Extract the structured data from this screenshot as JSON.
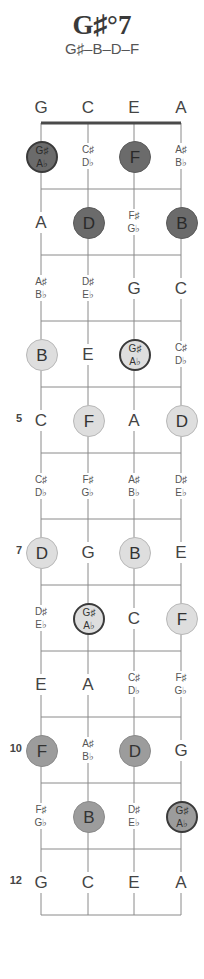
{
  "chord": {
    "title": "G♯°7",
    "notes_formula": "G♯–B–D–F"
  },
  "strings": [
    "G",
    "C",
    "E",
    "A"
  ],
  "fret_markers": [
    {
      "fret": 5,
      "label": "5"
    },
    {
      "fret": 7,
      "label": "7"
    },
    {
      "fret": 10,
      "label": "10"
    },
    {
      "fret": 12,
      "label": "12"
    }
  ],
  "rows": [
    {
      "fret": 1,
      "cells": [
        {
          "label": [
            "G♯",
            "A♭"
          ],
          "circle": "dark",
          "root": true
        },
        {
          "label": [
            "C♯",
            "D♭"
          ],
          "circle": "none"
        },
        {
          "label": [
            "F"
          ],
          "circle": "dark"
        },
        {
          "label": [
            "A♯",
            "B♭"
          ],
          "circle": "none"
        }
      ]
    },
    {
      "fret": 2,
      "cells": [
        {
          "label": [
            "A"
          ],
          "circle": "none"
        },
        {
          "label": [
            "D"
          ],
          "circle": "dark"
        },
        {
          "label": [
            "F♯",
            "G♭"
          ],
          "circle": "none"
        },
        {
          "label": [
            "B"
          ],
          "circle": "dark"
        }
      ]
    },
    {
      "fret": 3,
      "cells": [
        {
          "label": [
            "A♯",
            "B♭"
          ],
          "circle": "none"
        },
        {
          "label": [
            "D♯",
            "E♭"
          ],
          "circle": "none"
        },
        {
          "label": [
            "G"
          ],
          "circle": "none"
        },
        {
          "label": [
            "C"
          ],
          "circle": "none"
        }
      ]
    },
    {
      "fret": 4,
      "cells": [
        {
          "label": [
            "B"
          ],
          "circle": "light"
        },
        {
          "label": [
            "E"
          ],
          "circle": "none"
        },
        {
          "label": [
            "G♯",
            "A♭"
          ],
          "circle": "light",
          "root": true
        },
        {
          "label": [
            "C♯",
            "D♭"
          ],
          "circle": "none"
        }
      ]
    },
    {
      "fret": 5,
      "cells": [
        {
          "label": [
            "C"
          ],
          "circle": "none"
        },
        {
          "label": [
            "F"
          ],
          "circle": "light"
        },
        {
          "label": [
            "A"
          ],
          "circle": "none"
        },
        {
          "label": [
            "D"
          ],
          "circle": "light"
        }
      ]
    },
    {
      "fret": 6,
      "cells": [
        {
          "label": [
            "C♯",
            "D♭"
          ],
          "circle": "none"
        },
        {
          "label": [
            "F♯",
            "G♭"
          ],
          "circle": "none"
        },
        {
          "label": [
            "A♯",
            "B♭"
          ],
          "circle": "none"
        },
        {
          "label": [
            "D♯",
            "E♭"
          ],
          "circle": "none"
        }
      ]
    },
    {
      "fret": 7,
      "cells": [
        {
          "label": [
            "D"
          ],
          "circle": "light"
        },
        {
          "label": [
            "G"
          ],
          "circle": "none"
        },
        {
          "label": [
            "B"
          ],
          "circle": "light"
        },
        {
          "label": [
            "E"
          ],
          "circle": "none"
        }
      ]
    },
    {
      "fret": 8,
      "cells": [
        {
          "label": [
            "D♯",
            "E♭"
          ],
          "circle": "none"
        },
        {
          "label": [
            "G♯",
            "A♭"
          ],
          "circle": "light",
          "root": true
        },
        {
          "label": [
            "C"
          ],
          "circle": "none"
        },
        {
          "label": [
            "F"
          ],
          "circle": "light"
        }
      ]
    },
    {
      "fret": 9,
      "cells": [
        {
          "label": [
            "E"
          ],
          "circle": "none"
        },
        {
          "label": [
            "A"
          ],
          "circle": "none"
        },
        {
          "label": [
            "C♯",
            "D♭"
          ],
          "circle": "none"
        },
        {
          "label": [
            "F♯",
            "G♭"
          ],
          "circle": "none"
        }
      ]
    },
    {
      "fret": 10,
      "cells": [
        {
          "label": [
            "F"
          ],
          "circle": "medium"
        },
        {
          "label": [
            "A♯",
            "B♭"
          ],
          "circle": "none"
        },
        {
          "label": [
            "D"
          ],
          "circle": "medium"
        },
        {
          "label": [
            "G"
          ],
          "circle": "none"
        }
      ]
    },
    {
      "fret": 11,
      "cells": [
        {
          "label": [
            "F♯",
            "G♭"
          ],
          "circle": "none"
        },
        {
          "label": [
            "B"
          ],
          "circle": "medium"
        },
        {
          "label": [
            "D♯",
            "E♭"
          ],
          "circle": "none"
        },
        {
          "label": [
            "G♯",
            "A♭"
          ],
          "circle": "medium",
          "root": true
        }
      ]
    },
    {
      "fret": 12,
      "cells": [
        {
          "label": [
            "G"
          ],
          "circle": "none"
        },
        {
          "label": [
            "C"
          ],
          "circle": "none"
        },
        {
          "label": [
            "E"
          ],
          "circle": "none"
        },
        {
          "label": [
            "A"
          ],
          "circle": "none"
        }
      ]
    }
  ],
  "colors": {
    "dark": "#6b6b6b",
    "medium": "#9c9c9c",
    "light": "#dedede",
    "lines": "#8a8a8a",
    "nut": "#4a4a4a"
  }
}
